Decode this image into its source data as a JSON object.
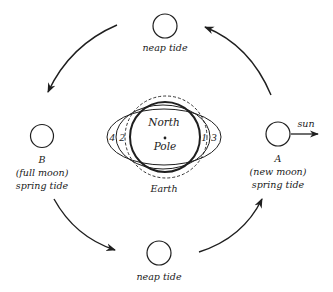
{
  "diagram": {
    "colors": {
      "ink": "#1f1f1f",
      "background": "#ffffff"
    },
    "moons": {
      "top": {
        "label": "neap tide"
      },
      "bottom": {
        "label": "neap tide"
      },
      "left": {
        "letter": "B",
        "phase": "(full moon)",
        "tide": "spring tide"
      },
      "right": {
        "letter": "A",
        "phase": "(new moon)",
        "tide": "spring tide"
      }
    },
    "sun_label": "sun",
    "earth": {
      "center_line1": "North",
      "center_line2": "Pole",
      "label": "Earth"
    },
    "bulge_numbers": {
      "n1": "1",
      "n2": "2",
      "n3": "3",
      "n4": "4"
    },
    "orbit_direction": "counterclockwise",
    "arrows": [
      {
        "from": "top",
        "to": "left"
      },
      {
        "from": "left",
        "to": "bottom"
      },
      {
        "from": "bottom",
        "to": "right"
      },
      {
        "from": "right",
        "to": "top"
      }
    ]
  }
}
